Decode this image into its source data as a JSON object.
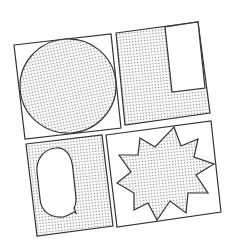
{
  "illustration": {
    "title": "Comic panel layout icon",
    "colors": {
      "background": "#ffffff",
      "stroke": "#333333",
      "dot": "#8a8a8a",
      "panel_fill": "#ffffff"
    },
    "panels": [
      {
        "id": "panel-1",
        "content": "circle",
        "shaded_shape": true
      },
      {
        "id": "panel-2",
        "content": "l-shape-with-white-box",
        "shaded_shape": true
      },
      {
        "id": "panel-3",
        "content": "speech-bubble",
        "shaded_background": true
      },
      {
        "id": "panel-4",
        "content": "starburst",
        "shaded_shape": true
      }
    ]
  }
}
